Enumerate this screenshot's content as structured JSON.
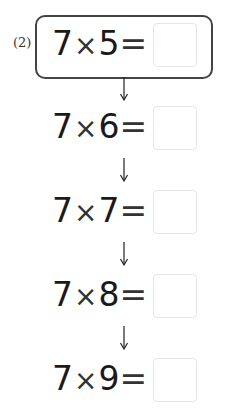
{
  "problem": {
    "label": "(2)",
    "rows": [
      {
        "a": "7",
        "op": "×",
        "b": "5",
        "eq": "=",
        "answer": ""
      },
      {
        "a": "7",
        "op": "×",
        "b": "6",
        "eq": "=",
        "answer": ""
      },
      {
        "a": "7",
        "op": "×",
        "b": "7",
        "eq": "=",
        "answer": ""
      },
      {
        "a": "7",
        "op": "×",
        "b": "8",
        "eq": "=",
        "answer": ""
      },
      {
        "a": "7",
        "op": "×",
        "b": "9",
        "eq": "=",
        "answer": ""
      }
    ]
  }
}
